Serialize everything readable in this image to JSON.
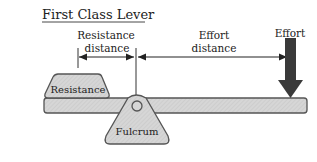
{
  "title": "First Class Lever",
  "labels": {
    "resistance_distance_line1": "Resistance",
    "resistance_distance_line2": "distance",
    "effort_distance_line1": "Effort",
    "effort_distance_line2": "distance",
    "effort": "Effort",
    "resistance": "Resistance",
    "fulcrum": "Fulcrum"
  },
  "colors": {
    "shape_fill": "#d4d4d4",
    "outline": "#555555",
    "arrow": "#333333",
    "text": "#222222"
  }
}
